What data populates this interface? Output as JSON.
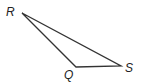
{
  "diagram": {
    "type": "triangle",
    "vertices": [
      {
        "label": "R",
        "x": 22,
        "y": 13,
        "lx": 6,
        "ly": 16
      },
      {
        "label": "Q",
        "x": 76,
        "y": 67,
        "lx": 64,
        "ly": 79
      },
      {
        "label": "S",
        "x": 121,
        "y": 66,
        "lx": 125,
        "ly": 72
      }
    ],
    "stroke_color": "#333333"
  }
}
